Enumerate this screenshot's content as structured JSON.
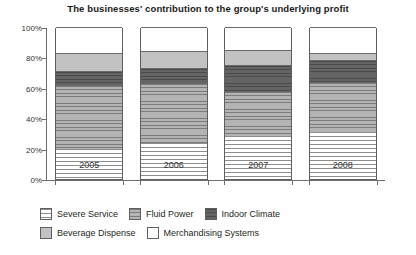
{
  "chart_data": {
    "type": "bar",
    "subtype": "stacked-percentage",
    "title": "The businesses' contribution to the group's underlying profit",
    "xlabel": "",
    "ylabel": "",
    "categories": [
      "2005",
      "2006",
      "2007",
      "2008"
    ],
    "ylim": [
      0,
      100
    ],
    "ytick_labels": [
      "0%",
      "20%",
      "40%",
      "60%",
      "80%",
      "100%"
    ],
    "ytick_values": [
      0,
      20,
      40,
      60,
      80,
      100
    ],
    "grid": false,
    "legend_position": "bottom",
    "series": [
      {
        "name": "Severe Service",
        "color": "#fdfdfd",
        "pattern": "horizontal-lines-light",
        "values": [
          20,
          24,
          28,
          31
        ]
      },
      {
        "name": "Fluid Power",
        "color": "#a6a6a6",
        "pattern": "horizontal-lines-medium",
        "values": [
          42,
          39,
          30,
          33
        ]
      },
      {
        "name": "Indoor Climate",
        "color": "#5d5d5d",
        "pattern": "horizontal-lines-dark",
        "values": [
          9,
          10,
          17,
          14
        ]
      },
      {
        "name": "Beverage Dispense",
        "color": "#c2c2c2",
        "pattern": "solid",
        "values": [
          12,
          11,
          10,
          5
        ]
      },
      {
        "name": "Merchandising Systems",
        "color": "#ffffff",
        "pattern": "solid",
        "values": [
          17,
          16,
          15,
          17
        ]
      }
    ]
  },
  "legend": {
    "rows": [
      [
        {
          "label": "Severe Service",
          "swatch": "severe"
        },
        {
          "label": "Fluid Power",
          "swatch": "fluid"
        },
        {
          "label": "Indoor Climate",
          "swatch": "indoor"
        }
      ],
      [
        {
          "label": "Beverage Dispense",
          "swatch": "beverage"
        },
        {
          "label": "Merchandising Systems",
          "swatch": "merch"
        }
      ]
    ]
  }
}
